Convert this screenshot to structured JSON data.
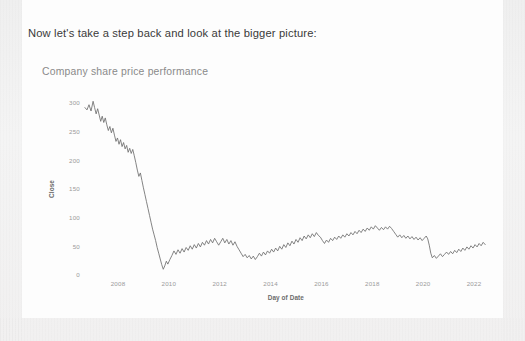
{
  "document": {
    "heading": "Now let's take a step back and look at the bigger picture:"
  },
  "chart_data": {
    "type": "line",
    "title": "Company share price performance",
    "xlabel": "Day of Date",
    "ylabel": "Close",
    "xtick_labels": [
      "2008",
      "2010",
      "2012",
      "2014",
      "2016",
      "2018",
      "2020",
      "2022"
    ],
    "xticks": [
      2008,
      2010,
      2012,
      2014,
      2016,
      2018,
      2020,
      2022
    ],
    "ytick_labels": [
      "0",
      "50",
      "100",
      "150",
      "200",
      "250",
      "300"
    ],
    "yticks": [
      0,
      50,
      100,
      150,
      200,
      250,
      300
    ],
    "xlim": [
      2006.6,
      2022.6
    ],
    "ylim": [
      0,
      310
    ],
    "grid": false,
    "legend": "none",
    "series": [
      {
        "name": "Close",
        "color": "#6e6e6e",
        "x": [
          2006.7,
          2006.78,
          2006.86,
          2006.94,
          2007.02,
          2007.08,
          2007.14,
          2007.2,
          2007.26,
          2007.32,
          2007.38,
          2007.44,
          2007.5,
          2007.56,
          2007.62,
          2007.68,
          2007.74,
          2007.8,
          2007.86,
          2007.92,
          2007.98,
          2008.04,
          2008.1,
          2008.16,
          2008.22,
          2008.28,
          2008.34,
          2008.4,
          2008.46,
          2008.52,
          2008.58,
          2008.64,
          2008.7,
          2008.76,
          2008.82,
          2008.88,
          2008.94,
          2009.0,
          2009.06,
          2009.12,
          2009.18,
          2009.24,
          2009.3,
          2009.36,
          2009.42,
          2009.48,
          2009.54,
          2009.6,
          2009.66,
          2009.72,
          2009.78,
          2009.84,
          2009.9,
          2009.96,
          2010.04,
          2010.12,
          2010.2,
          2010.28,
          2010.36,
          2010.44,
          2010.52,
          2010.6,
          2010.68,
          2010.76,
          2010.84,
          2010.92,
          2011.0,
          2011.08,
          2011.16,
          2011.24,
          2011.32,
          2011.4,
          2011.48,
          2011.56,
          2011.64,
          2011.72,
          2011.8,
          2011.88,
          2011.96,
          2012.04,
          2012.12,
          2012.2,
          2012.28,
          2012.36,
          2012.44,
          2012.52,
          2012.6,
          2012.68,
          2012.76,
          2012.84,
          2012.92,
          2013.0,
          2013.08,
          2013.16,
          2013.24,
          2013.32,
          2013.4,
          2013.48,
          2013.56,
          2013.64,
          2013.72,
          2013.8,
          2013.88,
          2013.96,
          2014.04,
          2014.12,
          2014.2,
          2014.28,
          2014.36,
          2014.44,
          2014.52,
          2014.6,
          2014.68,
          2014.76,
          2014.84,
          2014.92,
          2015.0,
          2015.08,
          2015.16,
          2015.24,
          2015.32,
          2015.4,
          2015.48,
          2015.56,
          2015.64,
          2015.72,
          2015.8,
          2015.88,
          2015.96,
          2016.04,
          2016.12,
          2016.2,
          2016.28,
          2016.36,
          2016.44,
          2016.52,
          2016.6,
          2016.68,
          2016.76,
          2016.84,
          2016.92,
          2017.0,
          2017.08,
          2017.16,
          2017.24,
          2017.32,
          2017.4,
          2017.48,
          2017.56,
          2017.64,
          2017.72,
          2017.8,
          2017.88,
          2017.96,
          2018.04,
          2018.12,
          2018.2,
          2018.28,
          2018.36,
          2018.44,
          2018.52,
          2018.6,
          2018.68,
          2018.76,
          2018.84,
          2018.92,
          2019.0,
          2019.08,
          2019.16,
          2019.24,
          2019.32,
          2019.4,
          2019.48,
          2019.56,
          2019.64,
          2019.72,
          2019.8,
          2019.88,
          2019.96,
          2020.04,
          2020.12,
          2020.18,
          2020.24,
          2020.3,
          2020.36,
          2020.44,
          2020.52,
          2020.6,
          2020.68,
          2020.76,
          2020.84,
          2020.92,
          2021.0,
          2021.08,
          2021.16,
          2021.24,
          2021.32,
          2021.4,
          2021.48,
          2021.56,
          2021.64,
          2021.72,
          2021.8,
          2021.88,
          2021.96,
          2022.04,
          2022.12,
          2022.2,
          2022.28,
          2022.36,
          2022.44
        ],
        "y": [
          292,
          288,
          297,
          286,
          303,
          292,
          281,
          290,
          279,
          268,
          277,
          266,
          274,
          262,
          252,
          259,
          248,
          256,
          244,
          233,
          239,
          228,
          236,
          224,
          231,
          220,
          226,
          214,
          221,
          212,
          219,
          208,
          196,
          183,
          172,
          178,
          165,
          152,
          140,
          128,
          116,
          104,
          92,
          80,
          70,
          60,
          48,
          38,
          28,
          18,
          10,
          16,
          24,
          19,
          27,
          34,
          42,
          36,
          44,
          38,
          46,
          40,
          48,
          43,
          51,
          45,
          53,
          47,
          55,
          49,
          57,
          52,
          60,
          54,
          62,
          56,
          64,
          58,
          52,
          58,
          64,
          56,
          62,
          54,
          60,
          52,
          58,
          50,
          44,
          38,
          32,
          36,
          30,
          34,
          28,
          33,
          27,
          32,
          38,
          33,
          40,
          35,
          42,
          38,
          45,
          40,
          47,
          42,
          50,
          45,
          53,
          48,
          56,
          51,
          59,
          54,
          62,
          57,
          65,
          60,
          68,
          63,
          70,
          65,
          72,
          67,
          74,
          69,
          66,
          60,
          55,
          61,
          57,
          64,
          60,
          66,
          62,
          68,
          64,
          70,
          66,
          72,
          68,
          74,
          70,
          76,
          72,
          78,
          74,
          80,
          76,
          82,
          78,
          84,
          80,
          86,
          82,
          78,
          83,
          79,
          84,
          80,
          85,
          81,
          76,
          71,
          66,
          70,
          65,
          69,
          64,
          68,
          63,
          67,
          62,
          66,
          61,
          65,
          60,
          64,
          68,
          63,
          52,
          38,
          30,
          34,
          29,
          33,
          37,
          32,
          36,
          40,
          36,
          41,
          37,
          43,
          39,
          45,
          41,
          47,
          43,
          49,
          45,
          51,
          47,
          53,
          49,
          55,
          51,
          57,
          53
        ]
      }
    ]
  }
}
